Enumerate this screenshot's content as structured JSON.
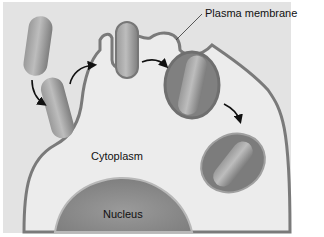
{
  "diagram": {
    "labels": {
      "plasma_membrane": "Plasma membrane",
      "cytoplasm": "Cytoplasm",
      "nucleus": "Nucleus"
    },
    "colors": {
      "background": "#e4e4e4",
      "cell_cytoplasm": "#ececec",
      "membrane": "#7a7a7a",
      "bacterium": "#8e8e8e",
      "vacuole": "#7b7b7b",
      "nucleus": "#8a8a8a",
      "arrow": "#111111"
    },
    "stages": [
      "bacterium-approach",
      "membrane-contact",
      "engulfment",
      "phagosome-pinching",
      "phagosome-internalized"
    ]
  }
}
